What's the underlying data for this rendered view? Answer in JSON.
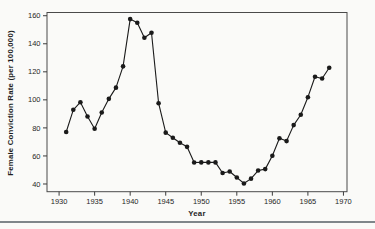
{
  "page": {
    "background_color": "#fafaf8",
    "rule_color": "#7f868a"
  },
  "chart_data": {
    "type": "line",
    "title": "",
    "xlabel": "Year",
    "ylabel": "Female Conviction Rate (per 100,000)",
    "x": [
      1931,
      1932,
      1933,
      1934,
      1935,
      1936,
      1937,
      1938,
      1939,
      1940,
      1941,
      1942,
      1943,
      1944,
      1945,
      1946,
      1947,
      1948,
      1949,
      1950,
      1951,
      1952,
      1953,
      1954,
      1955,
      1956,
      1957,
      1958,
      1959,
      1960,
      1961,
      1962,
      1963,
      1964,
      1965,
      1966,
      1967,
      1968
    ],
    "values": [
      77.1,
      92.9,
      98.3,
      88.1,
      79.4,
      91.0,
      100.7,
      108.7,
      123.9,
      157.6,
      155.0,
      144.3,
      147.9,
      97.6,
      76.6,
      73.0,
      69.4,
      66.5,
      55.3,
      55.4,
      55.4,
      55.4,
      47.8,
      48.9,
      44.6,
      40.4,
      43.8,
      49.6,
      50.6,
      60.1,
      72.6,
      70.6,
      82.0,
      89.4,
      101.9,
      116.5,
      115.2,
      122.9
    ],
    "xticks": [
      1930,
      1935,
      1940,
      1945,
      1950,
      1955,
      1960,
      1965,
      1970
    ],
    "yticks": [
      40,
      60,
      80,
      100,
      120,
      140,
      160
    ],
    "xlim": [
      1928.3,
      1970.5
    ],
    "ylim": [
      34.5,
      162.3
    ],
    "grid": false,
    "legend": "none",
    "marker": "filled-circle",
    "line_color": "#1a1a1a",
    "marker_color": "#1a1a1a",
    "frame_color": "#4a4a4a",
    "tick_color": "#3c3c3c"
  }
}
